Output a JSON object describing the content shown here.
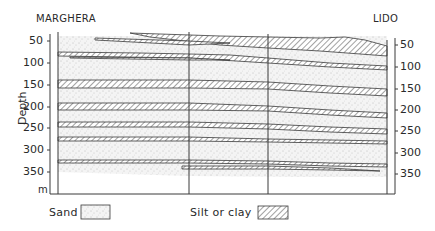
{
  "title_left": "MARGHERA",
  "title_right": "LIDO",
  "y_axis_label": "Depth",
  "y_axis_unit": "m",
  "y_ticks": [
    "50",
    "100",
    "150",
    "200",
    "250",
    "300",
    "350"
  ],
  "legend": {
    "sand_label": "Sand",
    "silt_label": "Silt or clay"
  },
  "colors": {
    "line": "#3a3a3a",
    "sand_dot": "#8a8a8a",
    "background": "#ffffff"
  }
}
